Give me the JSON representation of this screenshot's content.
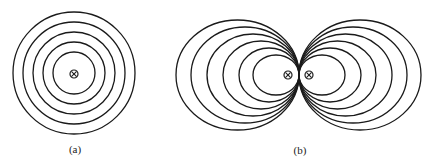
{
  "colors": {
    "line": "#1a1a1a",
    "background": "#ffffff"
  },
  "panels": [
    {
      "id": "a",
      "label": "(a)",
      "label_pos": [
        75,
        149
      ],
      "description": "Concentric circular field lines around a single wire carrying current into the page",
      "center": [
        74,
        73
      ],
      "ring_radii": [
        21,
        31,
        41,
        51,
        61
      ],
      "current_symbols": [
        {
          "x": 74,
          "y": 74,
          "symbol": "into-page"
        }
      ]
    },
    {
      "id": "b",
      "label": "(b)",
      "label_pos": [
        300,
        150
      ],
      "description": "Field lines of two parallel wires both carrying current into the page, forming two lobes of nested loops touching at the midpoint",
      "tangent_point": [
        299,
        75
      ],
      "left_lobe": {
        "rx": [
          23,
          30,
          38,
          46,
          54,
          61.5
        ],
        "ry": [
          20,
          27,
          34,
          41,
          48,
          55
        ]
      },
      "right_lobe": {
        "rx": [
          23,
          31,
          38.5,
          46.5,
          54,
          61
        ],
        "ry": [
          20,
          27,
          34,
          41,
          48,
          55
        ]
      },
      "current_symbols": [
        {
          "x": 288,
          "y": 75,
          "symbol": "into-page"
        },
        {
          "x": 309,
          "y": 75,
          "symbol": "into-page"
        }
      ]
    }
  ]
}
